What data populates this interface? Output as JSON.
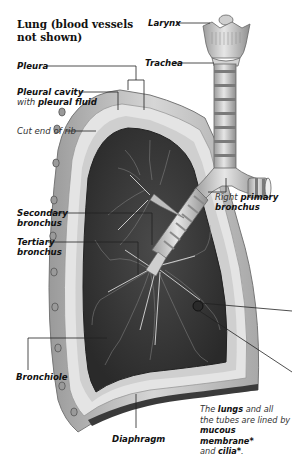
{
  "title": {
    "line1": "Lung (blood vessels",
    "line2": "not shown)"
  },
  "labels": {
    "larynx": "Larynx",
    "trachea": "Trachea",
    "pleura": "Pleura",
    "pleural_cavity": "Pleural cavity",
    "pleural_fluid_prefix": "with",
    "pleural_fluid": "pleural fluid",
    "cut_end_of_rib": "Cut end of rib",
    "right_primary_prefix": "Right",
    "right_primary": "primary",
    "right_primary_line2": "bronchus",
    "secondary_line1": "Secondary",
    "secondary_line2": "bronchus",
    "tertiary_line1": "Tertiary",
    "tertiary_line2": "bronchus",
    "bronchiole": "Bronchiole",
    "diaphragm": "Diaphragm"
  },
  "note": {
    "p1": "The",
    "k1": "lungs",
    "p2": "and all",
    "line2": "the tubes are lined by",
    "k2": "mucous membrane*",
    "p3": "and",
    "k3": "cilia*",
    "p4": "."
  },
  "colors": {
    "lung_tissue": "#3a3a3a",
    "pleura": "#d8d8d8",
    "rib_wall": "#bdbdbd",
    "airway": "#c8c8c8",
    "leader_line": "#222222"
  }
}
